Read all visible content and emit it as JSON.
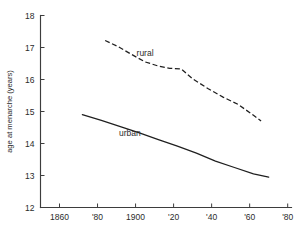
{
  "chart_data": {
    "type": "line",
    "title": "",
    "xlabel": "",
    "ylabel": "age at menarche (years)",
    "xlim": [
      1850,
      1982
    ],
    "ylim": [
      12,
      18
    ],
    "grid": false,
    "legend_position": "inline-annotation",
    "x_ticks": [
      1860,
      1880,
      1900,
      1920,
      1940,
      1960,
      1980
    ],
    "x_tick_labels": [
      "1860",
      "'80",
      "1900",
      "'20",
      "'40",
      "'60",
      "'80"
    ],
    "y_ticks": [
      12,
      13,
      14,
      15,
      16,
      17,
      18
    ],
    "y_tick_labels": [
      "12",
      "13",
      "14",
      "15",
      "16",
      "17",
      "18"
    ],
    "annotations": [
      {
        "text": "rural",
        "x": 1905,
        "y": 16.75
      },
      {
        "text": "urban",
        "x": 1897,
        "y": 14.25
      }
    ],
    "series": [
      {
        "name": "rural",
        "style": "dashed",
        "x": [
          1884,
          1891,
          1898,
          1905,
          1912,
          1918,
          1924,
          1930,
          1938,
          1946,
          1954,
          1962,
          1966
        ],
        "y": [
          17.22,
          17.02,
          16.78,
          16.55,
          16.42,
          16.35,
          16.33,
          16.02,
          15.72,
          15.45,
          15.22,
          14.88,
          14.7
        ]
      },
      {
        "name": "urban",
        "style": "solid",
        "x": [
          1872,
          1882,
          1892,
          1902,
          1912,
          1922,
          1932,
          1942,
          1952,
          1962,
          1970
        ],
        "y": [
          14.9,
          14.72,
          14.53,
          14.33,
          14.12,
          13.92,
          13.7,
          13.45,
          13.25,
          13.05,
          12.95
        ]
      }
    ]
  }
}
